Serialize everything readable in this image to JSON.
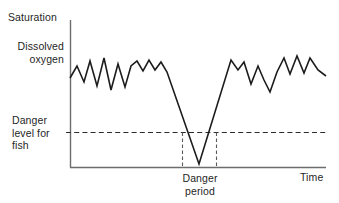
{
  "figure": {
    "kind": "line-chart",
    "background_color": "#ffffff",
    "line_color": "#1c1c1c",
    "axis_color": "#6d6d6d",
    "dashed_color": "#2b2b2b"
  },
  "labels": {
    "saturation": "Saturation",
    "dissolved_oxygen": "Dissolved\noxygen",
    "danger_level": "Danger\nlevel for\nfish",
    "danger_period": "Danger\nperiod",
    "time": "Time"
  },
  "chart_data": {
    "type": "line",
    "title": "",
    "xlabel": "Time",
    "ylabel": "Dissolved oxygen",
    "grid": false,
    "legend": null,
    "axis_top_label": "Saturation",
    "annotations": [
      {
        "name": "saturation-level",
        "text": "Saturation",
        "position": "y-axis-top"
      },
      {
        "name": "y-axis-title",
        "text": "Dissolved oxygen",
        "position": "y-axis-upper-left"
      },
      {
        "name": "threshold-label",
        "text": "Danger level for fish",
        "position": "y-axis-lower-left"
      },
      {
        "name": "danger-period-label",
        "text": "Danger period",
        "position": "x-axis-center"
      },
      {
        "name": "x-axis-title",
        "text": "Time",
        "position": "x-axis-right"
      }
    ],
    "axes": {
      "x_axis_pixel_y": 167,
      "y_axis_pixel_x": 70,
      "x_axis_pixel_x_end": 326,
      "y_axis_pixel_y_top": 20,
      "x_range_label": [
        "",
        "Time"
      ],
      "y_range_label": [
        "",
        "Saturation"
      ]
    },
    "threshold": {
      "name": "danger-level-for-fish",
      "pixel_y": 132,
      "style": "dashed-horizontal",
      "spans_from_x": 66,
      "spans_to_x": 326
    },
    "danger_period_band": {
      "name": "danger-period",
      "pixel_x_left": 182,
      "pixel_x_right": 216,
      "style": "dashed-vertical-pair",
      "top_pixel_y": 132,
      "bottom_pixel_y": 167
    },
    "series": [
      {
        "name": "Dissolved oxygen",
        "points": [
          [
            70,
            78
          ],
          [
            77,
            66
          ],
          [
            84,
            82
          ],
          [
            90,
            61
          ],
          [
            97,
            86
          ],
          [
            104,
            58
          ],
          [
            111,
            90
          ],
          [
            118,
            64
          ],
          [
            125,
            87
          ],
          [
            131,
            66
          ],
          [
            137,
            61
          ],
          [
            143,
            71
          ],
          [
            149,
            60
          ],
          [
            155,
            70
          ],
          [
            161,
            62
          ],
          [
            167,
            72
          ],
          [
            199,
            164
          ],
          [
            231,
            60
          ],
          [
            238,
            70
          ],
          [
            244,
            62
          ],
          [
            251,
            84
          ],
          [
            258,
            66
          ],
          [
            264,
            80
          ],
          [
            270,
            92
          ],
          [
            277,
            72
          ],
          [
            284,
            58
          ],
          [
            290,
            74
          ],
          [
            297,
            56
          ],
          [
            304,
            73
          ],
          [
            310,
            58
          ],
          [
            318,
            70
          ],
          [
            326,
            76
          ]
        ]
      }
    ]
  }
}
